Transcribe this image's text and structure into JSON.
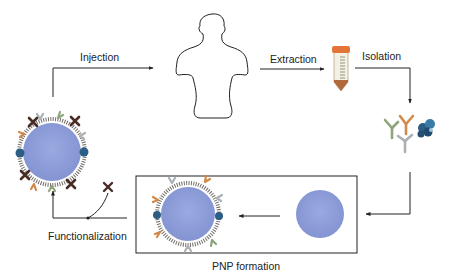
{
  "diagram": {
    "steps": [
      {
        "id": "injection",
        "label": "Injection"
      },
      {
        "id": "extraction",
        "label": "Extraction"
      },
      {
        "id": "isolation",
        "label": "Isolation"
      },
      {
        "id": "pnp_formation",
        "label": "PNP formation"
      },
      {
        "id": "functionalization",
        "label": "Functionalization"
      }
    ],
    "nodes": [
      {
        "id": "human",
        "icon": "human-silhouette-icon"
      },
      {
        "id": "tube",
        "icon": "sample-tube-icon"
      },
      {
        "id": "proteins",
        "icon": "antibody-cluster-icon"
      },
      {
        "id": "bare_sphere",
        "icon": "nanoparticle-icon"
      },
      {
        "id": "coated_np",
        "icon": "coated-nanoparticle-icon"
      },
      {
        "id": "functional_np",
        "icon": "functionalized-nanoparticle-icon"
      }
    ],
    "colors": {
      "sphere": "#8f9fd9",
      "antibody_green": "#8ea57c",
      "antibody_orange": "#d28a4a",
      "antibody_gray": "#aab0b4",
      "protein_blue": "#2b5d85",
      "ligand_dark": "#4a2c26",
      "tube_cap": "#e2743a",
      "line": "#222222"
    }
  }
}
